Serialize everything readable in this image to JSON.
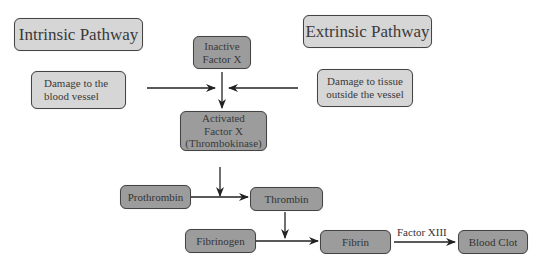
{
  "diagram": {
    "pathways": {
      "intrinsic": "Intrinsic Pathway",
      "extrinsic": "Extrinsic Pathway"
    },
    "triggers": {
      "intrinsic_line1": "Damage to the",
      "intrinsic_line2": "blood vessel",
      "extrinsic_line1": "Damage to tissue",
      "extrinsic_line2": "outside the vessel"
    },
    "nodes": {
      "inactive_factor_x_line1": "Inactive",
      "inactive_factor_x_line2": "Factor X",
      "activated_factor_x_line1": "Activated",
      "activated_factor_x_line2": "Factor X",
      "activated_factor_x_line3": "(Thrombokinase)",
      "prothrombin": "Prothrombin",
      "thrombin": "Thrombin",
      "fibrinogen": "Fibrinogen",
      "fibrin": "Fibrin",
      "blood_clot": "Blood Clot"
    },
    "edge_labels": {
      "fibrin_to_clot": "Factor XIII"
    },
    "edges": [
      {
        "from": "Damage to the blood vessel",
        "to": "Inactive Factor X -> Activated Factor X"
      },
      {
        "from": "Damage to tissue outside the vessel",
        "to": "Inactive Factor X -> Activated Factor X"
      },
      {
        "from": "Inactive Factor X",
        "to": "Activated Factor X"
      },
      {
        "from": "Activated Factor X",
        "to": "Prothrombin -> Thrombin"
      },
      {
        "from": "Prothrombin",
        "to": "Thrombin"
      },
      {
        "from": "Thrombin",
        "to": "Fibrinogen -> Fibrin"
      },
      {
        "from": "Fibrinogen",
        "to": "Fibrin"
      },
      {
        "from": "Fibrin",
        "to": "Blood Clot",
        "label": "Factor XIII"
      }
    ],
    "colors": {
      "light_box": "#d6d6d6",
      "dark_box": "#9c9c9c",
      "border": "#444444",
      "arrow": "#222222"
    }
  }
}
